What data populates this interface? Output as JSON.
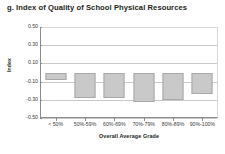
{
  "chart_data": {
    "type": "bar",
    "title": "g. Index of Quality of School Physical Resources",
    "xlabel": "Overall Average Grade",
    "ylabel": "Index",
    "categories": [
      "< 50%",
      "50%-59%",
      "60%-69%",
      "70%-79%",
      "80%-89%",
      "90%-100%"
    ],
    "values": [
      -0.08,
      -0.28,
      -0.28,
      -0.32,
      -0.3,
      -0.24
    ],
    "ylim": [
      -0.5,
      0.5
    ],
    "yticks": [
      0.5,
      0.3,
      0.1,
      -0.1,
      -0.3,
      -0.5
    ],
    "ytick_labels": [
      "0.50",
      "0.30",
      "0.10",
      "-0.10",
      "-0.30",
      "-0.50"
    ],
    "grid": true,
    "legend": "none",
    "bar_color": "#c9c9c9",
    "bar_border_color": "#a8a8a8",
    "axis_color": "#8d8d8d",
    "gridline_color": "#c9c9c9"
  }
}
